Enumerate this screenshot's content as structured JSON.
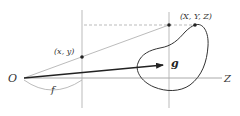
{
  "diagram": {
    "type": "pinhole-camera-projection",
    "labels": {
      "origin": "O",
      "image_point": "(x, y)",
      "world_point": "(X, Y, Z)",
      "optical_axis": "Z",
      "focal_length": "f",
      "gaze_vector": "g"
    },
    "colors": {
      "axis": "#aaaaaa",
      "ray": "#aaaaaa",
      "dashed": "#aaaaaa",
      "arrow": "#222222",
      "blob": "#333333",
      "points": "#222222",
      "text": "#333333"
    }
  }
}
